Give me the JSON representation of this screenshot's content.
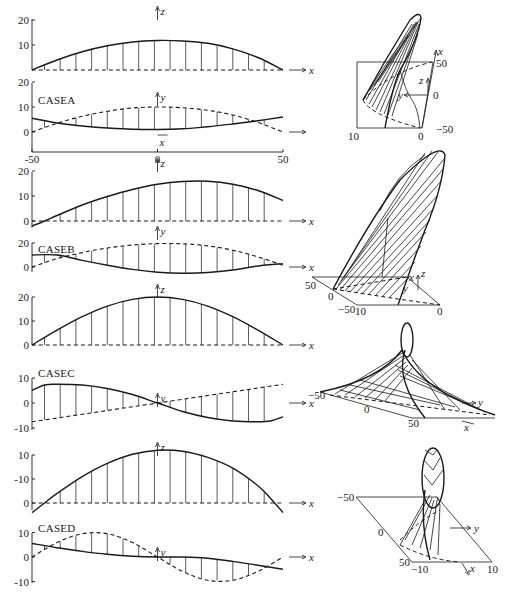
{
  "chart_data": [
    {
      "id": "A1",
      "type": "line",
      "case": "",
      "ylabel": "z",
      "xlabel": "x",
      "xlim": [
        -50,
        50
      ],
      "yticks": [
        "20",
        "10"
      ],
      "ytick_values": [
        20,
        10
      ],
      "series": [
        {
          "name": "z(x) solid",
          "style": "solid",
          "x": [
            -50,
            -40,
            -30,
            -20,
            -10,
            0,
            10,
            20,
            30,
            40,
            50
          ],
          "values": [
            0,
            4,
            7.3,
            9.7,
            11.2,
            11.8,
            11.6,
            10.7,
            8.5,
            5,
            0
          ]
        },
        {
          "name": "baseline dashed",
          "style": "dashed",
          "x": [
            -50,
            50
          ],
          "values": [
            0,
            0
          ]
        }
      ]
    },
    {
      "id": "A2",
      "type": "line",
      "case": "CASEA",
      "ylabel": "y",
      "xlabel": "x",
      "xlim": [
        -50,
        50
      ],
      "yticks": [
        "20",
        "10",
        "0"
      ],
      "ytick_values": [
        20,
        10,
        0
      ],
      "xticks": [
        "-50",
        "0",
        "50"
      ],
      "series": [
        {
          "name": "y(x) solid",
          "style": "solid",
          "x": [
            -50,
            -40,
            -30,
            -20,
            -10,
            0,
            10,
            20,
            30,
            40,
            50
          ],
          "values": [
            5.5,
            3.6,
            2.4,
            1.6,
            1.1,
            1,
            1.3,
            2.1,
            3.2,
            4.5,
            6
          ]
        },
        {
          "name": "y(x) dashed",
          "style": "dashed",
          "x": [
            -50,
            -40,
            -30,
            -20,
            -10,
            0,
            10,
            20,
            30,
            40,
            50
          ],
          "values": [
            0,
            3.5,
            6.3,
            8.3,
            9.6,
            10,
            9.7,
            8.7,
            6.8,
            3.8,
            0
          ]
        }
      ]
    },
    {
      "id": "B1",
      "type": "line",
      "case": "",
      "ylabel": "z",
      "xlabel": "x",
      "xlim": [
        -50,
        50
      ],
      "yticks": [
        "20",
        "10",
        "0"
      ],
      "ytick_values": [
        20,
        10,
        0
      ],
      "series": [
        {
          "name": "z(x) solid",
          "style": "solid",
          "x": [
            -50,
            -45,
            -40,
            -30,
            -20,
            -10,
            0,
            10,
            20,
            30,
            40,
            50
          ],
          "values": [
            -2,
            0,
            2.2,
            6.4,
            9.8,
            12.6,
            14.7,
            15.8,
            15.9,
            14.7,
            12.2,
            8.2
          ]
        },
        {
          "name": "baseline dashed",
          "style": "dashed",
          "x": [
            -50,
            50
          ],
          "values": [
            0,
            0
          ]
        }
      ]
    },
    {
      "id": "B2",
      "type": "line",
      "case": "CASEB",
      "ylabel": "y",
      "xlabel": "x",
      "xlim": [
        -50,
        50
      ],
      "yticks": [
        "20",
        "0"
      ],
      "ytick_values": [
        20,
        0
      ],
      "series": [
        {
          "name": "y(x) solid",
          "style": "solid",
          "x": [
            -50,
            -40,
            -30,
            -20,
            -10,
            0,
            10,
            20,
            30,
            40,
            50
          ],
          "values": [
            10,
            10,
            5.5,
            1.5,
            -2,
            -4.3,
            -5.2,
            -4.6,
            -2.5,
            0.8,
            2.8
          ]
        },
        {
          "name": "y(x) dashed",
          "style": "dashed",
          "x": [
            -50,
            -40,
            -30,
            -20,
            -10,
            0,
            10,
            20,
            30,
            40,
            50
          ],
          "values": [
            0,
            7,
            12,
            15.8,
            18.3,
            19.5,
            19.3,
            17.6,
            14,
            8.4,
            1.5
          ]
        }
      ]
    },
    {
      "id": "C1",
      "type": "line",
      "case": "",
      "ylabel": "z",
      "xlabel": "x",
      "xlim": [
        -50,
        50
      ],
      "yticks": [
        "20",
        "10",
        "0"
      ],
      "ytick_values": [
        20,
        10,
        0
      ],
      "series": [
        {
          "name": "z(x) solid",
          "style": "solid",
          "x": [
            -50,
            -40,
            -30,
            -20,
            -10,
            0,
            10,
            20,
            30,
            40,
            50
          ],
          "values": [
            0,
            6.2,
            11.8,
            16.2,
            19,
            20,
            19,
            16.2,
            11.8,
            6.2,
            0
          ]
        },
        {
          "name": "baseline dashed",
          "style": "dashed",
          "x": [
            -50,
            50
          ],
          "values": [
            0,
            0
          ]
        }
      ]
    },
    {
      "id": "C2",
      "type": "line",
      "case": "CASEC",
      "ylabel": "y",
      "xlabel": "x",
      "xlim": [
        -50,
        50
      ],
      "yticks": [
        "10",
        "0",
        "-10"
      ],
      "ytick_values": [
        10,
        0,
        -10
      ],
      "series": [
        {
          "name": "y(x) solid",
          "style": "solid",
          "x": [
            -50,
            -45,
            -40,
            -30,
            -20,
            -10,
            0,
            10,
            20,
            30,
            40,
            45,
            50
          ],
          "values": [
            5,
            7.2,
            7.5,
            7.2,
            5.8,
            3.4,
            0,
            -3.4,
            -5.8,
            -7.2,
            -7.5,
            -7.2,
            -5.5
          ]
        },
        {
          "name": "y(x) dashed",
          "style": "dashed",
          "x": [
            -50,
            50
          ],
          "values": [
            -7.5,
            7.5
          ]
        }
      ]
    },
    {
      "id": "D1",
      "type": "line",
      "case": "",
      "ylabel": "z",
      "xlabel": "x",
      "xlim": [
        -50,
        50
      ],
      "yticks": [
        "10",
        "-10",
        "0"
      ],
      "ytick_values": [
        20,
        10,
        0
      ],
      "series": [
        {
          "name": "z(x) solid",
          "style": "solid",
          "x": [
            -50,
            -45,
            -40,
            -30,
            -20,
            -10,
            0,
            10,
            20,
            30,
            40,
            45,
            50
          ],
          "values": [
            -4,
            0,
            4,
            11,
            16.5,
            20.3,
            22,
            21.6,
            19,
            14.5,
            7.2,
            2,
            -4
          ]
        },
        {
          "name": "baseline dashed",
          "style": "dashed",
          "x": [
            -50,
            50
          ],
          "values": [
            0,
            0
          ]
        }
      ]
    },
    {
      "id": "D2",
      "type": "line",
      "case": "CASED",
      "ylabel": "y",
      "xlabel": "x",
      "xlim": [
        -50,
        50
      ],
      "yticks": [
        "10",
        "0",
        "-10"
      ],
      "ytick_values": [
        10,
        0,
        -10
      ],
      "series": [
        {
          "name": "y(x) solid",
          "style": "solid",
          "x": [
            -50,
            -40,
            -30,
            -20,
            -10,
            0,
            10,
            20,
            30,
            40,
            50
          ],
          "values": [
            5.5,
            3.8,
            2.3,
            1.1,
            0.3,
            0,
            0,
            -0.5,
            -1.8,
            -3.4,
            -5
          ]
        },
        {
          "name": "y(x) dashed",
          "style": "dashed",
          "x": [
            -50,
            -40,
            -30,
            -20,
            -10,
            0,
            10,
            20,
            30,
            40,
            50
          ],
          "values": [
            0,
            5.9,
            9.5,
            9.5,
            5.9,
            0,
            -5.9,
            -9.5,
            -9.5,
            -5.9,
            0
          ]
        }
      ]
    }
  ],
  "panels3d": [
    {
      "id": "A3D",
      "labels": {
        "x_axis": "x",
        "y_axis": "y",
        "z_axis": "z",
        "t50": "50",
        "t0": "0",
        "tm50": "−50",
        "b10": "10",
        "b0": "0"
      }
    },
    {
      "id": "B3D",
      "labels": {
        "t50": "50",
        "t0": "0",
        "tm50": "−50",
        "b10": "10",
        "b0": "0",
        "x_axis": "x",
        "y_axis": "y",
        "z_axis": "z"
      }
    },
    {
      "id": "C3D",
      "labels": {
        "tm50": "−50",
        "t0": "0",
        "t50": "50",
        "y_axis": "y",
        "x_axis": "x"
      }
    },
    {
      "id": "D3D",
      "labels": {
        "tm50": "−50",
        "t0": "0",
        "t50": "50",
        "bm10": "−10",
        "b10": "10",
        "y_axis": "y",
        "x_axis": "x"
      }
    }
  ],
  "layout_x": {
    "px_left": 32,
    "px_right": 283
  }
}
